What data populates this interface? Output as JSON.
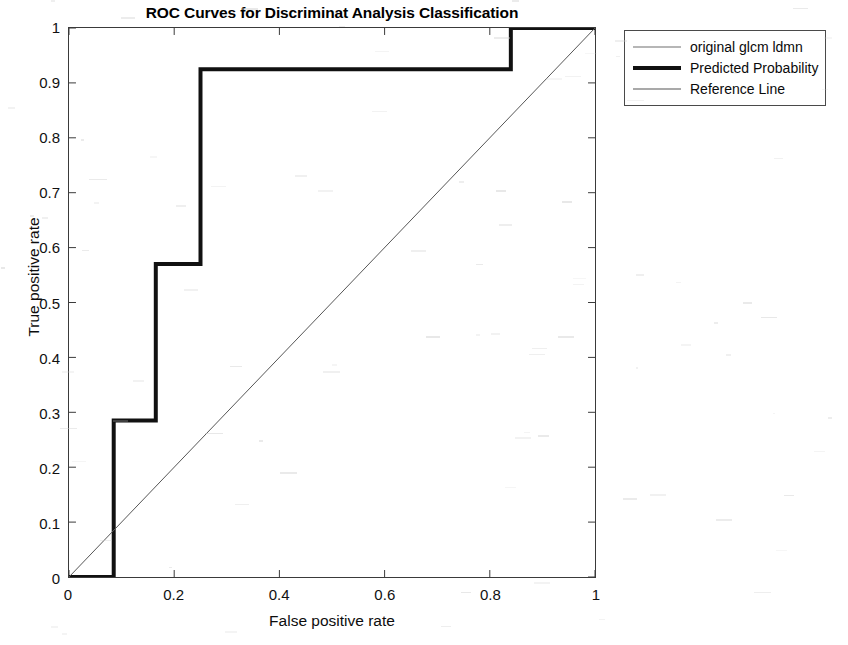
{
  "chart_data": {
    "type": "line",
    "title": "ROC Curves for Discriminat Analysis Classification",
    "xlabel": "False positive rate",
    "ylabel": "True positive rate",
    "xlim": [
      0,
      1
    ],
    "ylim": [
      0,
      1
    ],
    "grid": false,
    "legend_position": "outside-top-right",
    "xticks": [
      "0",
      "0.2",
      "0.4",
      "0.6",
      "0.8",
      "1"
    ],
    "xtick_values": [
      0,
      0.2,
      0.4,
      0.6,
      0.8,
      1
    ],
    "yticks": [
      "0",
      "0.1",
      "0.2",
      "0.3",
      "0.4",
      "0.5",
      "0.6",
      "0.7",
      "0.8",
      "0.9",
      "1"
    ],
    "ytick_values": [
      0,
      0.1,
      0.2,
      0.3,
      0.4,
      0.5,
      0.6,
      0.7,
      0.8,
      0.9,
      1
    ],
    "series": [
      {
        "name": "original glcm ldmn",
        "style": "thin",
        "color": "#6e6e6e",
        "width": 1,
        "x": [],
        "y": []
      },
      {
        "name": "Predicted Probability",
        "style": "thick-step",
        "color": "#111111",
        "width": 4,
        "x": [
          0,
          0.085,
          0.085,
          0.165,
          0.165,
          0.25,
          0.25,
          0.84,
          0.84,
          1
        ],
        "y": [
          0,
          0,
          0.285,
          0.285,
          0.57,
          0.57,
          0.925,
          0.925,
          1,
          1
        ]
      },
      {
        "name": "Reference Line",
        "style": "thin",
        "color": "#555555",
        "width": 1,
        "x": [
          0,
          1
        ],
        "y": [
          0,
          1
        ]
      }
    ]
  },
  "legend": {
    "items": [
      {
        "label": "original glcm ldmn",
        "swatch": "thin-line",
        "color": "#6e6e6e",
        "thickness": "1px"
      },
      {
        "label": "Predicted Probability",
        "swatch": "thick-line",
        "color": "#111111",
        "thickness": "4px"
      },
      {
        "label": "Reference Line",
        "swatch": "thin-line",
        "color": "#555555",
        "thickness": "1px"
      }
    ]
  },
  "colors": {
    "axis": "#3a3a3a",
    "text": "#111111",
    "thick_curve": "#111111",
    "reference_line": "#555555",
    "background": "#ffffff"
  }
}
